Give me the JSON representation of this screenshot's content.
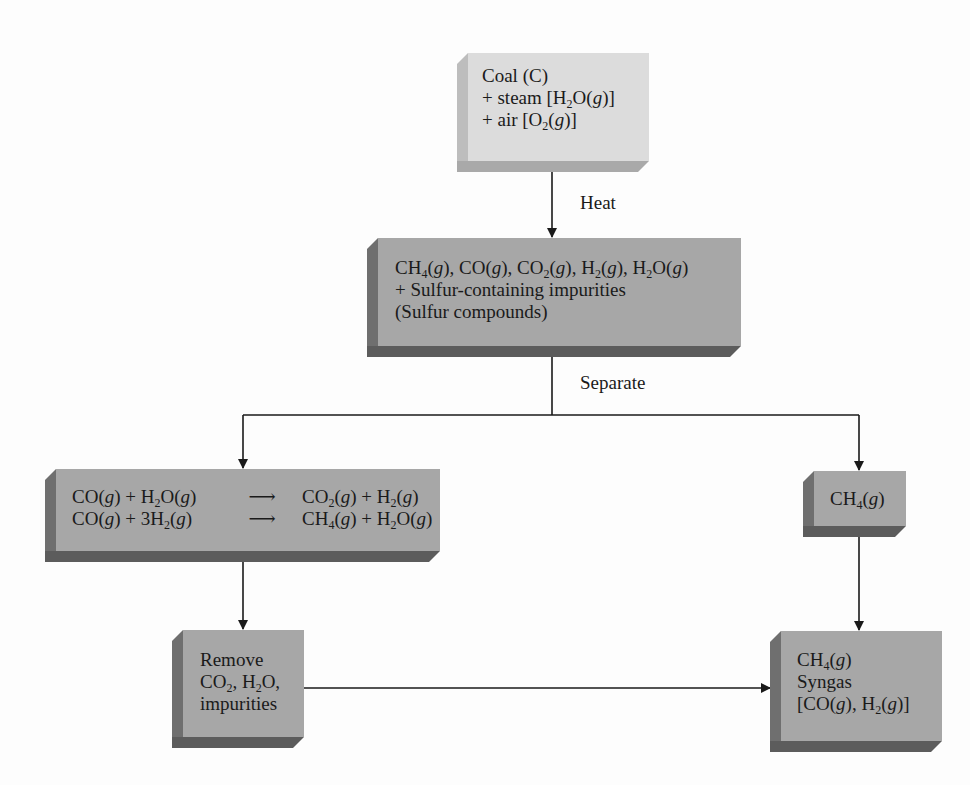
{
  "diagram": {
    "nodes": {
      "input": {
        "lines": [
          {
            "parts": [
              {
                "t": "Coal (C)"
              }
            ]
          },
          {
            "parts": [
              {
                "t": "+ steam [H"
              },
              {
                "sub": "2"
              },
              {
                "t": "O("
              },
              {
                "it": "g"
              },
              {
                "t": ")]"
              }
            ]
          },
          {
            "parts": [
              {
                "t": "+ air [O"
              },
              {
                "sub": "2"
              },
              {
                "t": "("
              },
              {
                "it": "g"
              },
              {
                "t": ")]"
              }
            ]
          }
        ]
      },
      "gas_mixture": {
        "lines": [
          {
            "parts": [
              {
                "t": "CH"
              },
              {
                "sub": "4"
              },
              {
                "t": "("
              },
              {
                "it": "g"
              },
              {
                "t": "), CO("
              },
              {
                "it": "g"
              },
              {
                "t": "), CO"
              },
              {
                "sub": "2"
              },
              {
                "t": "("
              },
              {
                "it": "g"
              },
              {
                "t": "), H"
              },
              {
                "sub": "2"
              },
              {
                "t": "("
              },
              {
                "it": "g"
              },
              {
                "t": "), H"
              },
              {
                "sub": "2"
              },
              {
                "t": "O("
              },
              {
                "it": "g"
              },
              {
                "t": ")"
              }
            ]
          },
          {
            "parts": [
              {
                "t": "+ Sulfur-containing impurities"
              }
            ]
          },
          {
            "parts": [
              {
                "t": "(Sulfur compounds)"
              }
            ]
          }
        ]
      },
      "reactions": {
        "equations": [
          {
            "left": [
              {
                "t": "CO("
              },
              {
                "it": "g"
              },
              {
                "t": ") + H"
              },
              {
                "sub": "2"
              },
              {
                "t": "O("
              },
              {
                "it": "g"
              },
              {
                "t": ")"
              }
            ],
            "arrow": "⟶",
            "right": [
              {
                "t": "CO"
              },
              {
                "sub": "2"
              },
              {
                "t": "("
              },
              {
                "it": "g"
              },
              {
                "t": ") + H"
              },
              {
                "sub": "2"
              },
              {
                "t": "("
              },
              {
                "it": "g"
              },
              {
                "t": ")"
              }
            ]
          },
          {
            "left": [
              {
                "t": "CO("
              },
              {
                "it": "g"
              },
              {
                "t": ") + 3H"
              },
              {
                "sub": "2"
              },
              {
                "t": "("
              },
              {
                "it": "g"
              },
              {
                "t": ")"
              }
            ],
            "arrow": "⟶",
            "right": [
              {
                "t": "CH"
              },
              {
                "sub": "4"
              },
              {
                "t": "("
              },
              {
                "it": "g"
              },
              {
                "t": ") + H"
              },
              {
                "sub": "2"
              },
              {
                "t": "O("
              },
              {
                "it": "g"
              },
              {
                "t": ")"
              }
            ]
          }
        ]
      },
      "methane": {
        "lines": [
          {
            "parts": [
              {
                "t": "CH"
              },
              {
                "sub": "4"
              },
              {
                "t": "("
              },
              {
                "it": "g"
              },
              {
                "t": ")"
              }
            ]
          }
        ]
      },
      "remove": {
        "lines": [
          {
            "parts": [
              {
                "t": "Remove"
              }
            ]
          },
          {
            "parts": [
              {
                "t": "CO"
              },
              {
                "sub": "2"
              },
              {
                "t": ", H"
              },
              {
                "sub": "2"
              },
              {
                "t": "O,"
              }
            ]
          },
          {
            "parts": [
              {
                "t": "impurities"
              }
            ]
          }
        ]
      },
      "product": {
        "lines": [
          {
            "parts": [
              {
                "t": "CH"
              },
              {
                "sub": "4"
              },
              {
                "t": "("
              },
              {
                "it": "g"
              },
              {
                "t": ")"
              }
            ]
          },
          {
            "parts": [
              {
                "t": "Syngas"
              }
            ]
          },
          {
            "parts": [
              {
                "t": "[CO("
              },
              {
                "it": "g"
              },
              {
                "t": "), H"
              },
              {
                "sub": "2"
              },
              {
                "t": "("
              },
              {
                "it": "g"
              },
              {
                "t": ")]"
              }
            ]
          }
        ]
      }
    },
    "edge_labels": {
      "heat": "Heat",
      "separate": "Separate"
    },
    "edges": [
      {
        "from": "input",
        "to": "gas_mixture",
        "label": "Heat"
      },
      {
        "from": "gas_mixture",
        "to": "reactions",
        "label": "Separate"
      },
      {
        "from": "gas_mixture",
        "to": "methane",
        "label": "Separate"
      },
      {
        "from": "reactions",
        "to": "remove"
      },
      {
        "from": "remove",
        "to": "product"
      },
      {
        "from": "methane",
        "to": "product"
      }
    ],
    "colors": {
      "light_box_face": "#dcdcdc",
      "dark_box_face": "#a7a7a7",
      "line": "#1a1a1a"
    }
  }
}
